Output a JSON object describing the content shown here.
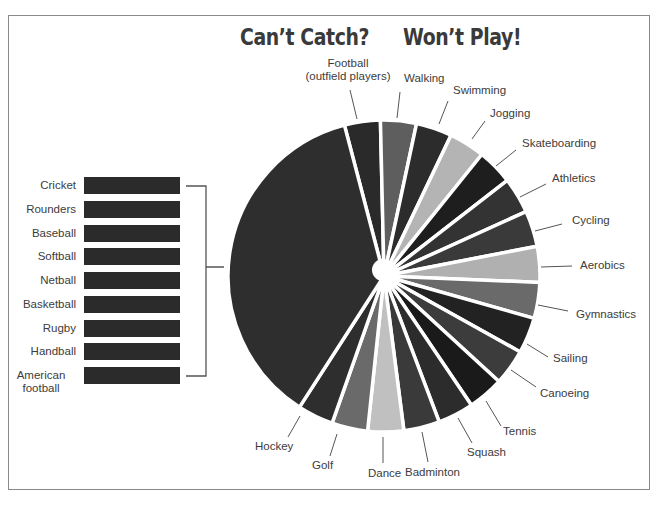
{
  "title": {
    "left": "Can’t Catch?",
    "right": "Won’t Play!"
  },
  "chart_data": {
    "type": "pie",
    "start_angle_deg": 345.3,
    "direction": "clockwise",
    "unit_note": "relative shares read from slice angles; each individual sport ≈ 1 unit, grouped ball sports ≈ 10 units",
    "slices": [
      {
        "label": "Football (outfield players)",
        "value": 1,
        "color": "#2a2a2a"
      },
      {
        "label": "Walking",
        "value": 1,
        "color": "#5e5e5e"
      },
      {
        "label": "Swimming",
        "value": 1,
        "color": "#2c2c2c"
      },
      {
        "label": "Jogging",
        "value": 1,
        "color": "#b4b4b4"
      },
      {
        "label": "Skateboarding",
        "value": 1,
        "color": "#1e1e1e"
      },
      {
        "label": "Athletics",
        "value": 1,
        "color": "#333333"
      },
      {
        "label": "Cycling",
        "value": 1,
        "color": "#3a3a3a"
      },
      {
        "label": "Aerobics",
        "value": 1,
        "color": "#b0b0b0"
      },
      {
        "label": "Gymnastics",
        "value": 1,
        "color": "#6a6a6a"
      },
      {
        "label": "Sailing",
        "value": 1,
        "color": "#222222"
      },
      {
        "label": "Canoeing",
        "value": 1,
        "color": "#3c3c3c"
      },
      {
        "label": "Tennis",
        "value": 1,
        "color": "#1a1a1a"
      },
      {
        "label": "Squash",
        "value": 1,
        "color": "#2c2c2c"
      },
      {
        "label": "Badminton",
        "value": 1,
        "color": "#3a3a3a"
      },
      {
        "label": "Dance",
        "value": 1,
        "color": "#c0c0c0"
      },
      {
        "label": "Golf",
        "value": 1,
        "color": "#6a6a6a"
      },
      {
        "label": "Hockey",
        "value": 1,
        "color": "#2e2e2e"
      },
      {
        "label": "Catching ball sports (grouped)",
        "value": 9.9,
        "color": "#2e2e2e"
      }
    ],
    "grouped_legend": {
      "items": [
        "Cricket",
        "Rounders",
        "Baseball",
        "Softball",
        "Netball",
        "Basketball",
        "Rugby",
        "Handball",
        "American football"
      ],
      "bar_color": "#2b2b2b"
    },
    "legend_position": "left",
    "grid": false
  },
  "labels": [
    {
      "text": [
        "Football",
        "(outfield players)"
      ],
      "x": 348,
      "y": 67,
      "anchor": "middle",
      "line": [
        350,
        90,
        357,
        119
      ]
    },
    {
      "text": [
        "Walking"
      ],
      "x": 404,
      "y": 82,
      "anchor": "start",
      "line": [
        400,
        92,
        397,
        118
      ]
    },
    {
      "text": [
        "Swimming"
      ],
      "x": 453,
      "y": 94,
      "anchor": "start",
      "line": [
        448,
        101,
        439,
        124
      ]
    },
    {
      "text": [
        "Jogging"
      ],
      "x": 490,
      "y": 117,
      "anchor": "start",
      "line": [
        485,
        121,
        472,
        139
      ]
    },
    {
      "text": [
        "Skateboarding"
      ],
      "x": 522,
      "y": 147,
      "anchor": "start",
      "line": [
        516,
        150,
        496,
        166
      ]
    },
    {
      "text": [
        "Athletics"
      ],
      "x": 552,
      "y": 182,
      "anchor": "start",
      "line": [
        546,
        184,
        520,
        197
      ]
    },
    {
      "text": [
        "Cycling"
      ],
      "x": 572,
      "y": 224,
      "anchor": "start",
      "line": [
        562,
        224,
        535,
        231
      ]
    },
    {
      "text": [
        "Aerobics"
      ],
      "x": 580,
      "y": 269,
      "anchor": "start",
      "line": [
        572,
        266,
        541,
        267
      ]
    },
    {
      "text": [
        "Gymnastics"
      ],
      "x": 576,
      "y": 318,
      "anchor": "start",
      "line": [
        568,
        311,
        538,
        305
      ]
    },
    {
      "text": [
        "Sailing"
      ],
      "x": 553,
      "y": 362,
      "anchor": "start",
      "line": [
        548,
        357,
        527,
        344
      ]
    },
    {
      "text": [
        "Canoeing"
      ],
      "x": 540,
      "y": 397,
      "anchor": "start",
      "line": [
        536,
        387,
        511,
        370
      ]
    },
    {
      "text": [
        "Tennis"
      ],
      "x": 503,
      "y": 435,
      "anchor": "start",
      "line": [
        501,
        426,
        486,
        401
      ]
    },
    {
      "text": [
        "Squash"
      ],
      "x": 467,
      "y": 456,
      "anchor": "start",
      "line": [
        472,
        443,
        458,
        418
      ]
    },
    {
      "text": [
        "Badminton"
      ],
      "x": 405,
      "y": 476,
      "anchor": "start",
      "line": [
        428,
        462,
        422,
        432
      ]
    },
    {
      "text": [
        "Dance"
      ],
      "x": 368,
      "y": 477,
      "anchor": "middle-start",
      "line": [
        383,
        463,
        383,
        437
      ]
    },
    {
      "text": [
        "Golf"
      ],
      "x": 312,
      "y": 469,
      "anchor": "start",
      "line": [
        330,
        456,
        337,
        434
      ]
    },
    {
      "text": [
        "Hockey"
      ],
      "x": 255,
      "y": 450,
      "anchor": "start",
      "line": [
        288,
        437,
        300,
        416
      ]
    }
  ],
  "pie": {
    "cx": 384,
    "cy": 276,
    "r": 156,
    "gap_color": "#ffffff"
  }
}
